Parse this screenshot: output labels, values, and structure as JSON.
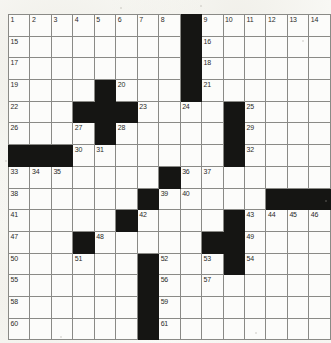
{
  "puzzle": {
    "kind": "crossword-grid",
    "rows": 15,
    "cols": 15,
    "cell_size_px": 20.7,
    "colors": {
      "block": "#151513",
      "cell": "#fcfcfa",
      "grid_line": "#8a8a86",
      "number_text": "#2b2b28",
      "paper": "#fbfbf8"
    },
    "block_cells": [
      [
        1,
        9
      ],
      [
        2,
        9
      ],
      [
        3,
        9
      ],
      [
        4,
        5
      ],
      [
        4,
        9
      ],
      [
        5,
        4
      ],
      [
        5,
        5
      ],
      [
        5,
        6
      ],
      [
        5,
        11
      ],
      [
        6,
        5
      ],
      [
        6,
        11
      ],
      [
        7,
        1
      ],
      [
        7,
        2
      ],
      [
        7,
        3
      ],
      [
        7,
        11
      ],
      [
        8,
        8
      ],
      [
        9,
        7
      ],
      [
        9,
        13
      ],
      [
        9,
        14
      ],
      [
        9,
        15
      ],
      [
        10,
        6
      ],
      [
        10,
        11
      ],
      [
        11,
        4
      ],
      [
        11,
        10
      ],
      [
        11,
        11
      ],
      [
        12,
        7
      ],
      [
        12,
        11
      ],
      [
        13,
        7
      ],
      [
        14,
        7
      ],
      [
        15,
        7
      ]
    ],
    "numbered_cells": [
      {
        "n": 1,
        "row": 1,
        "col": 1
      },
      {
        "n": 2,
        "row": 1,
        "col": 2
      },
      {
        "n": 3,
        "row": 1,
        "col": 3
      },
      {
        "n": 4,
        "row": 1,
        "col": 4
      },
      {
        "n": 5,
        "row": 1,
        "col": 5
      },
      {
        "n": 6,
        "row": 1,
        "col": 6
      },
      {
        "n": 7,
        "row": 1,
        "col": 7
      },
      {
        "n": 8,
        "row": 1,
        "col": 8
      },
      {
        "n": 9,
        "row": 1,
        "col": 10
      },
      {
        "n": 10,
        "row": 1,
        "col": 11
      },
      {
        "n": 11,
        "row": 1,
        "col": 12
      },
      {
        "n": 12,
        "row": 1,
        "col": 13
      },
      {
        "n": 13,
        "row": 1,
        "col": 14
      },
      {
        "n": 14,
        "row": 1,
        "col": 15
      },
      {
        "n": 15,
        "row": 2,
        "col": 1
      },
      {
        "n": 16,
        "row": 2,
        "col": 10
      },
      {
        "n": 17,
        "row": 3,
        "col": 1
      },
      {
        "n": 18,
        "row": 3,
        "col": 10
      },
      {
        "n": 19,
        "row": 4,
        "col": 1
      },
      {
        "n": 20,
        "row": 4,
        "col": 6
      },
      {
        "n": 21,
        "row": 4,
        "col": 10
      },
      {
        "n": 22,
        "row": 5,
        "col": 1
      },
      {
        "n": 23,
        "row": 5,
        "col": 7
      },
      {
        "n": 24,
        "row": 5,
        "col": 9
      },
      {
        "n": 25,
        "row": 5,
        "col": 12
      },
      {
        "n": 26,
        "row": 6,
        "col": 1
      },
      {
        "n": 27,
        "row": 6,
        "col": 4
      },
      {
        "n": 28,
        "row": 6,
        "col": 6
      },
      {
        "n": 29,
        "row": 6,
        "col": 12
      },
      {
        "n": 30,
        "row": 7,
        "col": 4
      },
      {
        "n": 31,
        "row": 7,
        "col": 5
      },
      {
        "n": 32,
        "row": 7,
        "col": 12
      },
      {
        "n": 33,
        "row": 8,
        "col": 1
      },
      {
        "n": 34,
        "row": 8,
        "col": 2
      },
      {
        "n": 35,
        "row": 8,
        "col": 3
      },
      {
        "n": 36,
        "row": 8,
        "col": 9
      },
      {
        "n": 37,
        "row": 8,
        "col": 10
      },
      {
        "n": 38,
        "row": 9,
        "col": 1
      },
      {
        "n": 39,
        "row": 9,
        "col": 8
      },
      {
        "n": 40,
        "row": 9,
        "col": 9
      },
      {
        "n": 41,
        "row": 10,
        "col": 1
      },
      {
        "n": 42,
        "row": 10,
        "col": 7
      },
      {
        "n": 43,
        "row": 10,
        "col": 12
      },
      {
        "n": 44,
        "row": 10,
        "col": 13
      },
      {
        "n": 45,
        "row": 10,
        "col": 14
      },
      {
        "n": 46,
        "row": 10,
        "col": 15
      },
      {
        "n": 47,
        "row": 11,
        "col": 1
      },
      {
        "n": 48,
        "row": 11,
        "col": 5
      },
      {
        "n": 49,
        "row": 11,
        "col": 12
      },
      {
        "n": 50,
        "row": 12,
        "col": 1
      },
      {
        "n": 51,
        "row": 12,
        "col": 4
      },
      {
        "n": 52,
        "row": 12,
        "col": 8
      },
      {
        "n": 53,
        "row": 12,
        "col": 10
      },
      {
        "n": 54,
        "row": 12,
        "col": 12
      },
      {
        "n": 55,
        "row": 13,
        "col": 1
      },
      {
        "n": 56,
        "row": 13,
        "col": 8
      },
      {
        "n": 57,
        "row": 13,
        "col": 10
      },
      {
        "n": 58,
        "row": 14,
        "col": 1
      },
      {
        "n": 59,
        "row": 14,
        "col": 8
      },
      {
        "n": 60,
        "row": 15,
        "col": 1
      },
      {
        "n": 61,
        "row": 15,
        "col": 8
      }
    ],
    "filled_answers": []
  }
}
